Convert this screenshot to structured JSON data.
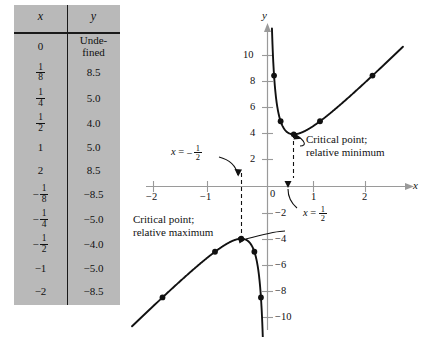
{
  "figure": {
    "table": {
      "headers": {
        "x": "x",
        "y": "y"
      },
      "rows": [
        {
          "x_num": "0",
          "x_den": "",
          "x_neg": false,
          "x_plain": "0",
          "y": "Unde-",
          "y2": "fined"
        },
        {
          "x_num": "1",
          "x_den": "8",
          "x_neg": false,
          "x_plain": "",
          "y": "8.5",
          "y2": ""
        },
        {
          "x_num": "1",
          "x_den": "4",
          "x_neg": false,
          "x_plain": "",
          "y": "5.0",
          "y2": ""
        },
        {
          "x_num": "1",
          "x_den": "2",
          "x_neg": false,
          "x_plain": "",
          "y": "4.0",
          "y2": ""
        },
        {
          "x_num": "",
          "x_den": "",
          "x_neg": false,
          "x_plain": "1",
          "y": "5.0",
          "y2": ""
        },
        {
          "x_num": "",
          "x_den": "",
          "x_neg": false,
          "x_plain": "2",
          "y": "8.5",
          "y2": ""
        },
        {
          "x_num": "1",
          "x_den": "8",
          "x_neg": true,
          "x_plain": "",
          "y": "−8.5",
          "y2": ""
        },
        {
          "x_num": "1",
          "x_den": "4",
          "x_neg": true,
          "x_plain": "",
          "y": "−5.0",
          "y2": ""
        },
        {
          "x_num": "1",
          "x_den": "2",
          "x_neg": true,
          "x_plain": "",
          "y": "−4.0",
          "y2": ""
        },
        {
          "x_num": "",
          "x_den": "",
          "x_neg": true,
          "x_plain": "−1",
          "y": "−5.0",
          "y2": ""
        },
        {
          "x_num": "",
          "x_den": "",
          "x_neg": true,
          "x_plain": "−2",
          "y": "−8.5",
          "y2": ""
        }
      ]
    },
    "axes": {
      "x_axis_label": "x",
      "y_axis_label": "y",
      "x_ticks": [
        "−2",
        "−1",
        "1",
        "2"
      ],
      "y_ticks": [
        "10",
        "8",
        "6",
        "4",
        "2",
        "−2",
        "−4",
        "−6",
        "−8",
        "−10"
      ],
      "origin_label": "0"
    },
    "annotations": {
      "min_line1": "Critical point;",
      "min_line2": "relative minimum",
      "max_line1": "Critical point;",
      "max_line2": "relative maximum",
      "vline_left_label": {
        "lhs": "x",
        "eq": "=",
        "neg": "−",
        "num": "1",
        "den": "2"
      },
      "vline_right_label": {
        "lhs": "x",
        "eq": "=",
        "neg": "",
        "num": "1",
        "den": "2"
      }
    },
    "colors": {
      "table_bg": "#b9b9b9",
      "curve": "#111111",
      "axis": "#9a9a9a",
      "ink": "#111111"
    }
  },
  "chart_data": {
    "type": "line",
    "title": "",
    "xlabel": "x",
    "ylabel": "y",
    "xlim": [
      -2.6,
      2.6
    ],
    "ylim": [
      -11.5,
      11.5
    ],
    "grid": false,
    "legend": "none",
    "function": "y = 4x + 1/x",
    "series": [
      {
        "name": "right branch (x > 0)",
        "points": [
          {
            "x": 0.125,
            "y": 8.5,
            "marker": true
          },
          {
            "x": 0.25,
            "y": 5.0,
            "marker": true
          },
          {
            "x": 0.5,
            "y": 4.0,
            "marker": true
          },
          {
            "x": 1,
            "y": 5.0,
            "marker": true
          },
          {
            "x": 2,
            "y": 8.5,
            "marker": true
          }
        ]
      },
      {
        "name": "left branch (x < 0)",
        "points": [
          {
            "x": -0.125,
            "y": -8.5,
            "marker": true
          },
          {
            "x": -0.25,
            "y": -5.0,
            "marker": true
          },
          {
            "x": -0.5,
            "y": -4.0,
            "marker": true
          },
          {
            "x": -1,
            "y": -5.0,
            "marker": true
          },
          {
            "x": -2,
            "y": -8.5,
            "marker": true
          }
        ]
      }
    ],
    "critical_points": [
      {
        "x": 0.5,
        "y": 4.0,
        "kind": "relative minimum"
      },
      {
        "x": -0.5,
        "y": -4.0,
        "kind": "relative maximum"
      }
    ],
    "vertical_dashed_lines": [
      {
        "x": -0.5
      },
      {
        "x": 0.5
      }
    ],
    "x_ticks": [
      -2,
      -1,
      1,
      2
    ],
    "y_ticks": [
      10,
      8,
      6,
      4,
      2,
      -2,
      -4,
      -6,
      -8,
      -10
    ]
  }
}
